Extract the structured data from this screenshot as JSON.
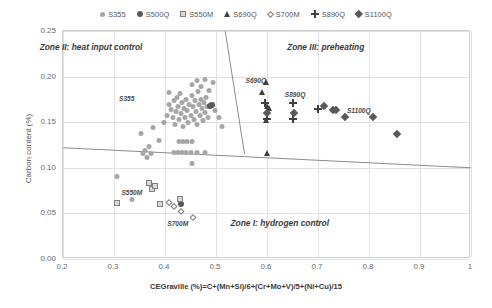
{
  "chart_data": {
    "type": "scatter",
    "title": "",
    "xlabel": "CEGraville (%)=C+(Mn+Si)/6+(Cr+Mo+V)/5+(Ni+Cu)/15",
    "ylabel": "Carbon content (%)",
    "xlim": [
      0.2,
      1.0
    ],
    "ylim": [
      0.0,
      0.25
    ],
    "xticks": [
      "0.2",
      "0.3",
      "0.4",
      "0.5",
      "0.6",
      "0.7",
      "0.8",
      "0.9",
      "1"
    ],
    "xtick_values": [
      0.2,
      0.3,
      0.4,
      0.5,
      0.6,
      0.7,
      0.8,
      0.9,
      1.0
    ],
    "yticks": [
      "0.00",
      "0.05",
      "0.10",
      "0.15",
      "0.20",
      "0.25"
    ],
    "ytick_values": [
      0.0,
      0.05,
      0.1,
      0.15,
      0.2,
      0.25
    ],
    "grid": true,
    "legend_position": "top",
    "legend": [
      {
        "label": "S355",
        "marker": "circle-light",
        "color": "#a6a6a6"
      },
      {
        "label": "S500Q",
        "marker": "circle-dark",
        "color": "#595959"
      },
      {
        "label": "S550M",
        "marker": "square-open",
        "color": "#808080"
      },
      {
        "label": "S690Q",
        "marker": "triangle",
        "color": "#404040"
      },
      {
        "label": "S700M",
        "marker": "diamond-open",
        "color": "#808080"
      },
      {
        "label": "S890Q",
        "marker": "plus",
        "color": "#404040"
      },
      {
        "label": "S1100Q",
        "marker": "diamond-fill",
        "color": "#595959"
      }
    ],
    "annotations": [
      {
        "text": "Zone II: heat input control",
        "x": 0.255,
        "y": 0.232,
        "kind": "zone"
      },
      {
        "text": "Zone III: preheating",
        "x": 0.715,
        "y": 0.232,
        "kind": "zone"
      },
      {
        "text": "Zone I: hydrogen control",
        "x": 0.625,
        "y": 0.04,
        "kind": "zone"
      },
      {
        "text": "S355",
        "x": 0.325,
        "y": 0.176,
        "kind": "series"
      },
      {
        "text": "S550M",
        "x": 0.335,
        "y": 0.073,
        "kind": "series"
      },
      {
        "text": "S700M",
        "x": 0.425,
        "y": 0.04,
        "kind": "series"
      },
      {
        "text": "S690Q",
        "x": 0.578,
        "y": 0.196,
        "kind": "series"
      },
      {
        "text": "S890Q",
        "x": 0.655,
        "y": 0.181,
        "kind": "series"
      },
      {
        "text": "S1100Q",
        "x": 0.78,
        "y": 0.163,
        "kind": "series"
      }
    ],
    "zone_lines": [
      {
        "name": "graville-lower-boundary",
        "x1": 0.2,
        "y1": 0.122,
        "x2": 1.0,
        "y2": 0.1
      },
      {
        "name": "graville-upper-boundary",
        "x1": 0.518,
        "y1": 0.25,
        "x2": 0.556,
        "y2": 0.115
      }
    ],
    "series": [
      {
        "name": "S355",
        "marker": "circle-light",
        "color": "#a6a6a6",
        "points": [
          [
            0.305,
            0.093
          ],
          [
            0.335,
            0.068
          ],
          [
            0.352,
            0.14
          ],
          [
            0.377,
            0.147
          ],
          [
            0.388,
            0.133
          ],
          [
            0.398,
            0.152
          ],
          [
            0.404,
            0.16
          ],
          [
            0.408,
            0.172
          ],
          [
            0.412,
            0.167
          ],
          [
            0.415,
            0.158
          ],
          [
            0.418,
            0.176
          ],
          [
            0.42,
            0.15
          ],
          [
            0.422,
            0.165
          ],
          [
            0.424,
            0.18
          ],
          [
            0.426,
            0.17
          ],
          [
            0.428,
            0.156
          ],
          [
            0.43,
            0.184
          ],
          [
            0.432,
            0.162
          ],
          [
            0.434,
            0.174
          ],
          [
            0.436,
            0.148
          ],
          [
            0.438,
            0.168
          ],
          [
            0.44,
            0.158
          ],
          [
            0.442,
            0.178
          ],
          [
            0.444,
            0.166
          ],
          [
            0.446,
            0.152
          ],
          [
            0.448,
            0.172
          ],
          [
            0.45,
            0.16
          ],
          [
            0.452,
            0.182
          ],
          [
            0.454,
            0.17
          ],
          [
            0.456,
            0.156
          ],
          [
            0.458,
            0.176
          ],
          [
            0.46,
            0.164
          ],
          [
            0.462,
            0.15
          ],
          [
            0.464,
            0.186
          ],
          [
            0.466,
            0.172
          ],
          [
            0.468,
            0.16
          ],
          [
            0.47,
            0.178
          ],
          [
            0.472,
            0.168
          ],
          [
            0.474,
            0.155
          ],
          [
            0.476,
            0.174
          ],
          [
            0.478,
            0.163
          ],
          [
            0.48,
            0.18
          ],
          [
            0.482,
            0.17
          ],
          [
            0.484,
            0.158
          ],
          [
            0.452,
            0.194
          ],
          [
            0.462,
            0.198
          ],
          [
            0.47,
            0.192
          ],
          [
            0.478,
            0.2
          ],
          [
            0.486,
            0.188
          ],
          [
            0.494,
            0.196
          ],
          [
            0.428,
            0.132
          ],
          [
            0.436,
            0.132
          ],
          [
            0.444,
            0.132
          ],
          [
            0.452,
            0.132
          ],
          [
            0.418,
            0.12
          ],
          [
            0.426,
            0.12
          ],
          [
            0.434,
            0.12
          ],
          [
            0.442,
            0.12
          ],
          [
            0.45,
            0.12
          ],
          [
            0.462,
            0.12
          ],
          [
            0.478,
            0.12
          ],
          [
            0.36,
            0.122
          ],
          [
            0.368,
            0.126
          ],
          [
            0.372,
            0.118
          ],
          [
            0.364,
            0.114
          ],
          [
            0.356,
            0.118
          ],
          [
            0.49,
            0.172
          ],
          [
            0.498,
            0.166
          ],
          [
            0.506,
            0.158
          ],
          [
            0.452,
            0.108
          ],
          [
            0.512,
            0.148
          ],
          [
            0.408,
            0.185
          ]
        ]
      },
      {
        "name": "S500Q",
        "marker": "circle-dark",
        "color": "#595959",
        "points": [
          [
            0.488,
            0.17
          ],
          [
            0.492,
            0.171
          ],
          [
            0.432,
            0.062
          ]
        ]
      },
      {
        "name": "S550M",
        "marker": "square-open",
        "color": "#808080",
        "points": [
          [
            0.368,
            0.085
          ],
          [
            0.374,
            0.079
          ],
          [
            0.38,
            0.082
          ],
          [
            0.305,
            0.064
          ],
          [
            0.39,
            0.062
          ],
          [
            0.43,
            0.068
          ]
        ]
      },
      {
        "name": "S690Q",
        "marker": "triangle",
        "color": "#404040",
        "points": [
          [
            0.598,
            0.196
          ],
          [
            0.59,
            0.185
          ],
          [
            0.6,
            0.17
          ],
          [
            0.604,
            0.168
          ],
          [
            0.598,
            0.155
          ],
          [
            0.6,
            0.118
          ]
        ]
      },
      {
        "name": "S700M",
        "marker": "diamond-open",
        "color": "#808080",
        "points": [
          [
            0.408,
            0.065
          ],
          [
            0.418,
            0.06
          ],
          [
            0.432,
            0.055
          ],
          [
            0.455,
            0.048
          ]
        ]
      },
      {
        "name": "S890Q",
        "marker": "plus",
        "color": "#404040",
        "points": [
          [
            0.596,
            0.172
          ],
          [
            0.65,
            0.172
          ],
          [
            0.6,
            0.155
          ],
          [
            0.65,
            0.155
          ],
          [
            0.7,
            0.166
          ]
        ]
      },
      {
        "name": "S1100Q",
        "marker": "diamond-fill",
        "color": "#595959",
        "points": [
          [
            0.6,
            0.163
          ],
          [
            0.652,
            0.163
          ],
          [
            0.712,
            0.17
          ],
          [
            0.73,
            0.166
          ],
          [
            0.736,
            0.166
          ],
          [
            0.752,
            0.158
          ],
          [
            0.808,
            0.158
          ],
          [
            0.855,
            0.14
          ]
        ]
      }
    ]
  }
}
